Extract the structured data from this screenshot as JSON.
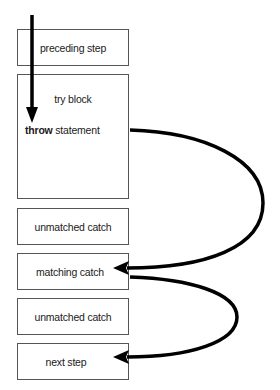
{
  "diagram": {
    "boxes": [
      {
        "id": "preceding",
        "label": "preceding step"
      },
      {
        "id": "try",
        "label": "try block"
      },
      {
        "id": "unmatched1",
        "label": "unmatched catch"
      },
      {
        "id": "matching",
        "label": "matching catch"
      },
      {
        "id": "unmatched2",
        "label": "unmatched catch"
      },
      {
        "id": "next",
        "label": "next step"
      }
    ],
    "throw_keyword": "throw",
    "throw_rest": " statement",
    "arrows": [
      {
        "from": "entry",
        "to": "throw statement",
        "kind": "straight-down"
      },
      {
        "from": "throw statement",
        "to": "matching catch",
        "kind": "curve"
      },
      {
        "from": "matching catch",
        "to": "next step",
        "kind": "curve"
      }
    ],
    "colors": {
      "stroke": "#000000",
      "box_border": "#555555",
      "background": "#ffffff"
    }
  }
}
